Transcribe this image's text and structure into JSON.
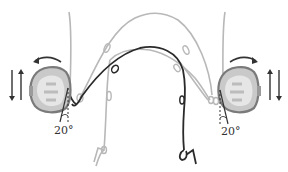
{
  "diagram": {
    "colors": {
      "background": "#ffffff",
      "gray_wire": "#b8b8b8",
      "black_wire": "#2a2a2a",
      "tooth_outline": "#7a7a7a",
      "tooth_fill": "#c9c9c9",
      "tooth_inner": "#e6e6e6",
      "arrow": "#333333"
    },
    "left_molar": {
      "angle_label": "20°",
      "rotation_direction": "counter-clockwise",
      "vertical_arrows": "up-down"
    },
    "right_molar": {
      "angle_label": "20°",
      "rotation_direction": "clockwise",
      "vertical_arrows": "up-down"
    },
    "wires": [
      {
        "name": "outer-gray-arch",
        "color": "gray"
      },
      {
        "name": "inner-gray-arch",
        "color": "gray"
      },
      {
        "name": "black-arch",
        "color": "black"
      }
    ]
  }
}
